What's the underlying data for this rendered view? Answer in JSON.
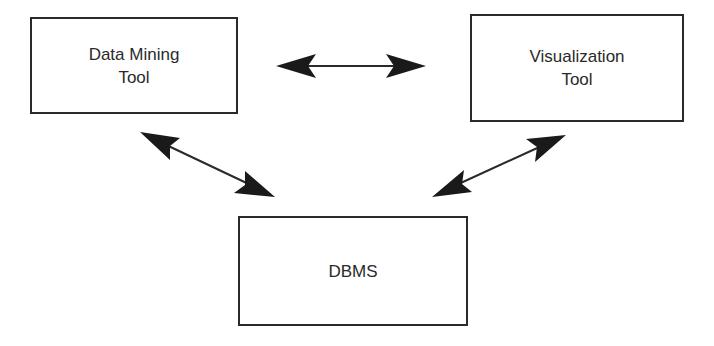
{
  "diagram": {
    "type": "block-diagram",
    "nodes": [
      {
        "id": "data-mining-tool",
        "line1": "Data Mining",
        "line2": "Tool"
      },
      {
        "id": "visualization-tool",
        "line1": "Visualization",
        "line2": "Tool"
      },
      {
        "id": "dbms",
        "line1": "DBMS",
        "line2": ""
      }
    ],
    "edges": [
      {
        "from": "data-mining-tool",
        "to": "visualization-tool",
        "style": "bidirectional"
      },
      {
        "from": "data-mining-tool",
        "to": "dbms",
        "style": "bidirectional"
      },
      {
        "from": "visualization-tool",
        "to": "dbms",
        "style": "bidirectional"
      }
    ],
    "colors": {
      "stroke": "#2a2a2a",
      "background": "#ffffff"
    }
  }
}
